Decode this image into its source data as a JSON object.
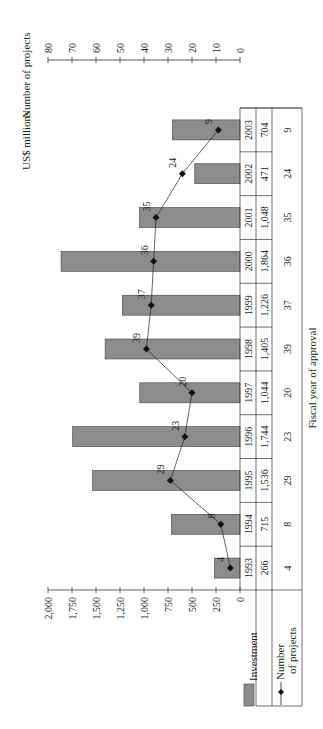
{
  "chart_data": {
    "type": "bar",
    "title": "",
    "xlabel": "Fiscal year of approval",
    "ylabel": "US$ millions",
    "y2label": "Number of projects",
    "orientation": "rotated-90-clockwise",
    "categories": [
      "1993",
      "1994",
      "1995",
      "1996",
      "1997",
      "1998",
      "1999",
      "2000",
      "2001",
      "2002",
      "2003"
    ],
    "series": [
      {
        "name": "Investment",
        "type": "bar",
        "axis": "left",
        "values": [
          266,
          715,
          1536,
          1744,
          1044,
          1405,
          1226,
          1864,
          1048,
          471,
          704
        ],
        "display": [
          "266",
          "715",
          "1,536",
          "1,744",
          "1,044",
          "1,405",
          "1,226",
          "1,864",
          "1,048",
          "471",
          "704"
        ]
      },
      {
        "name": "Number of projects",
        "type": "line",
        "axis": "right",
        "values": [
          4,
          8,
          29,
          23,
          20,
          39,
          37,
          36,
          35,
          24,
          9
        ]
      }
    ],
    "ylim": [
      0,
      2000
    ],
    "y_ticks": [
      "0",
      "250",
      "500",
      "750",
      "1,000",
      "1,250",
      "1,500",
      "1,750",
      "2,000"
    ],
    "y2lim": [
      0,
      80
    ],
    "y2_ticks": [
      "0",
      "10",
      "20",
      "30",
      "40",
      "50",
      "60",
      "70",
      "80"
    ],
    "legend": {
      "position": "table-left",
      "entries": [
        "Investment",
        "Number of projects"
      ]
    },
    "grid": false,
    "colors": {
      "bar": "#8c8c8c",
      "bar_edge": "#444444",
      "line": "#222222",
      "marker": "#111111"
    }
  },
  "legend": {
    "investment_label": "Investment",
    "projects_label_1": "Number",
    "projects_label_2": "of projects"
  }
}
